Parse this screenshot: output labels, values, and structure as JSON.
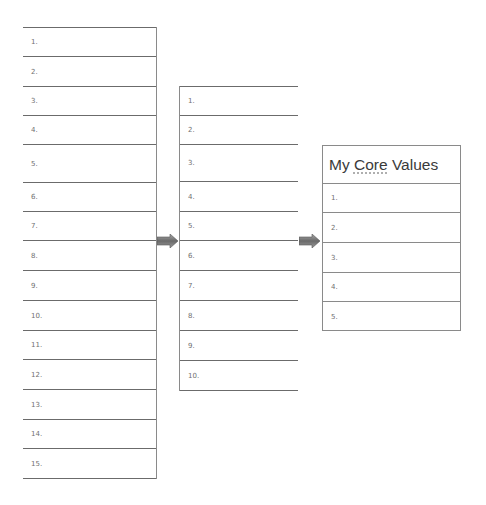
{
  "left_list": {
    "items": [
      "1.",
      "2.",
      "3.",
      "4.",
      "5.",
      "6.",
      "7.",
      "8.",
      "9.",
      "10.",
      "11.",
      "12.",
      "13.",
      "14.",
      "15."
    ],
    "row_tops": [
      0,
      29,
      59,
      88,
      117,
      155,
      184,
      213,
      243,
      273,
      303,
      332,
      362,
      392,
      421
    ],
    "row_heights": [
      29,
      30,
      29,
      29,
      38,
      29,
      29,
      30,
      30,
      30,
      29,
      30,
      30,
      29,
      30
    ]
  },
  "middle_list": {
    "items": [
      "1.",
      "2.",
      "3.",
      "4.",
      "5.",
      "6.",
      "7.",
      "8.",
      "9.",
      "10."
    ],
    "row_tops": [
      0,
      29,
      58,
      95,
      125,
      154,
      184,
      214,
      244,
      274
    ],
    "row_heights": [
      29,
      29,
      37,
      30,
      29,
      30,
      30,
      30,
      30,
      30
    ]
  },
  "core_values": {
    "title_prefix": "My ",
    "title_spell": "Core",
    "title_suffix": " Values",
    "items": [
      "1.",
      "2.",
      "3.",
      "4.",
      "5."
    ],
    "row_tops": [
      37,
      66,
      96,
      126,
      155
    ],
    "row_heights": [
      29,
      30,
      30,
      29,
      30
    ]
  },
  "arrows": [
    {
      "name": "arrow-left-to-middle",
      "x": 157,
      "y": 234
    },
    {
      "name": "arrow-middle-to-right",
      "x": 299,
      "y": 234
    }
  ],
  "colors": {
    "arrow_dark": "#5a5a5a",
    "arrow_light": "#a8a8a8",
    "line": "#6b6b6b"
  }
}
